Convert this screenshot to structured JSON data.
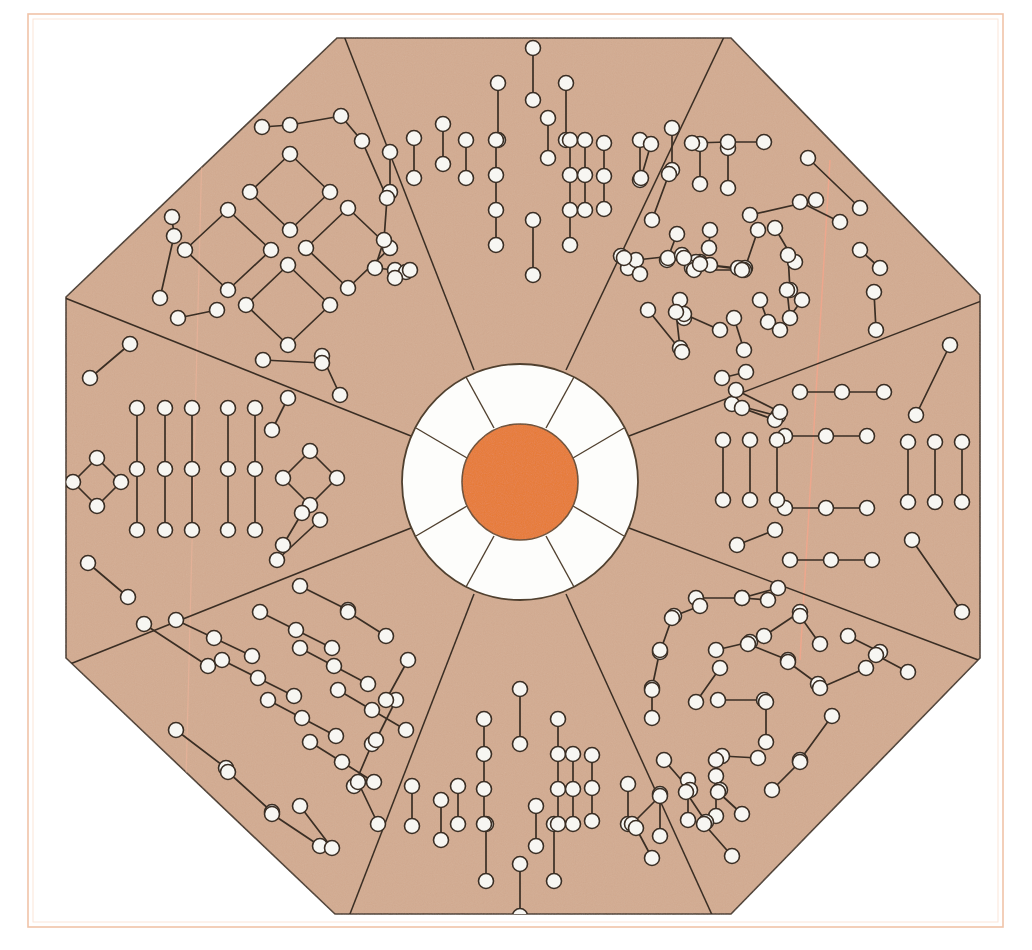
{
  "page": {
    "width": 1032,
    "height": 950,
    "background_color": "#ffffff"
  },
  "frame": {
    "name": "page-border",
    "stroke_color": "#f0c3a8",
    "stroke_width": 1.4,
    "x": 28,
    "y": 14,
    "width": 975,
    "height": 913
  },
  "colors": {
    "paper_white": "#ffffff",
    "octagon_fill": "#d3ab90",
    "octagon_stroke": "#4a3a2c",
    "hub_ring_fill": "#fdfdfb",
    "hub_ring_stroke": "#50402f",
    "hub_core_fill": "#e87a33",
    "hub_core_stroke": "#6b4a2c",
    "node_fill": "#f7f6f2",
    "node_stroke": "#3a2e24",
    "edge_stroke": "#3a2e24",
    "faint_pink_line": "#f2a68c"
  },
  "octagon": {
    "name": "octagon-outline",
    "center_x": 520,
    "center_y": 477,
    "vertices": [
      [
        337,
        38
      ],
      [
        731,
        38
      ],
      [
        980,
        295
      ],
      [
        980,
        658
      ],
      [
        731,
        914
      ],
      [
        335,
        914
      ],
      [
        66,
        658
      ],
      [
        66,
        297
      ]
    ]
  },
  "hub": {
    "name": "central-hub",
    "center_x": 520,
    "center_y": 482,
    "ring_radius": 118,
    "core_radius": 58,
    "spoke_count": 8,
    "spoke_angles_deg": [
      22,
      67,
      112,
      157,
      202,
      247,
      292,
      337
    ]
  },
  "divider_lines": {
    "name": "sector-dividers",
    "description": "Eight straight lines radiating from the hub ring out to the octagon vertices, splitting the annulus into eight sectors."
  },
  "faint_lines": [
    {
      "name": "faint-vertical-line-right",
      "x1": 828,
      "y1": 190,
      "x2": 800,
      "y2": 640
    },
    {
      "name": "faint-vertical-line-left",
      "x1": 200,
      "y1": 160,
      "x2": 185,
      "y2": 760
    }
  ],
  "chart_data": {
    "type": "scatter",
    "xlabel": "",
    "ylabel": "",
    "node_radius": 7.5,
    "node_count": 310,
    "sector_count": 8,
    "sectors": [
      {
        "id": "sector-north",
        "label": "North",
        "motif": "symmetric vertical chains, tallest at center",
        "node_count": 40
      },
      {
        "id": "sector-northeast",
        "label": "Northeast",
        "motif": "irregular scattered short chains",
        "node_count": 38
      },
      {
        "id": "sector-east",
        "label": "East",
        "motif": "horizontal three-node chains flanked by vertical pairs",
        "node_count": 36
      },
      {
        "id": "sector-southeast",
        "label": "Southeast",
        "motif": "irregular scattered short chains",
        "node_count": 38
      },
      {
        "id": "sector-south",
        "label": "South",
        "motif": "symmetric vertical chains, tallest at center (mirror of north)",
        "node_count": 40
      },
      {
        "id": "sector-southwest",
        "label": "Southwest",
        "motif": "diagonal parallel chains",
        "node_count": 38
      },
      {
        "id": "sector-west",
        "label": "West",
        "motif": "five vertical three-node chains flanked by small diamonds",
        "node_count": 36
      },
      {
        "id": "sector-northwest",
        "label": "Northwest",
        "motif": "four diamond rings enclosed by an outer ring chain",
        "node_count": 44
      }
    ],
    "nodes": [
      [
        533,
        48
      ],
      [
        548,
        78
      ],
      [
        517,
        83
      ],
      [
        582,
        95
      ],
      [
        500,
        110
      ],
      [
        566,
        126
      ],
      [
        443,
        124
      ],
      [
        466,
        124
      ],
      [
        414,
        138
      ],
      [
        533,
        140
      ],
      [
        495,
        140
      ],
      [
        548,
        140
      ],
      [
        585,
        140
      ],
      [
        603,
        140
      ],
      [
        640,
        140
      ],
      [
        690,
        143
      ],
      [
        736,
        144
      ],
      [
        498,
        160
      ],
      [
        570,
        158
      ],
      [
        607,
        163
      ],
      [
        435,
        160
      ],
      [
        466,
        176
      ],
      [
        414,
        178
      ],
      [
        495,
        180
      ],
      [
        548,
        175
      ],
      [
        585,
        178
      ],
      [
        622,
        163
      ],
      [
        655,
        163
      ],
      [
        680,
        152
      ],
      [
        727,
        160
      ],
      [
        601,
        180
      ],
      [
        533,
        220
      ],
      [
        533,
        275
      ],
      [
        498,
        196
      ],
      [
        570,
        196
      ],
      [
        604,
        198
      ],
      [
        648,
        196
      ],
      [
        495,
        176
      ],
      [
        437,
        143
      ],
      [
        466,
        143
      ]
    ],
    "edges_note": "Each visible edge joins two adjacent node circles with a thin dark line; chains run vertically in the north and south sectors, horizontally in the east sector, diagonally in the southwest sector, and form closed diamonds in the northwest and west sectors."
  }
}
